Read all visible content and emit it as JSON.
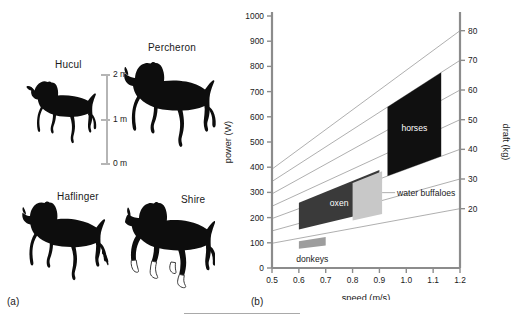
{
  "figure": {
    "panel_a": {
      "tag": "(a)",
      "breeds": [
        {
          "name": "Hucul",
          "icon": "horse-silhouette"
        },
        {
          "name": "Percheron",
          "icon": "horse-silhouette"
        },
        {
          "name": "Haflinger",
          "icon": "horse-silhouette"
        },
        {
          "name": "Shire",
          "icon": "horse-silhouette"
        }
      ],
      "scale_bar": {
        "ticks": [
          "2 m",
          "1 m",
          "0 m"
        ],
        "color": "#b5b5b5"
      }
    },
    "panel_b": {
      "tag": "(b)"
    }
  },
  "chart_data": {
    "type": "area",
    "title": "",
    "xlabel": "speed (m/s)",
    "ylabel": "power (W)",
    "y2label": "draft (kg)",
    "xlim": [
      0.5,
      1.2
    ],
    "ylim": [
      0,
      1000
    ],
    "y2lim": [
      0,
      85
    ],
    "grid": false,
    "legend": "inline-annotations",
    "xticks": [
      "0.5",
      "0.6",
      "0.7",
      "0.8",
      "0.9",
      "1.0",
      "1.1",
      "1.2"
    ],
    "xtick_values": [
      0.5,
      0.6,
      0.7,
      0.8,
      0.9,
      1.0,
      1.1,
      1.2
    ],
    "yticks": [
      "0",
      "100",
      "200",
      "300",
      "400",
      "500",
      "600",
      "700",
      "800",
      "900",
      "1000"
    ],
    "ytick_values": [
      0,
      100,
      200,
      300,
      400,
      500,
      600,
      700,
      800,
      900,
      1000
    ],
    "y2ticks": [
      "20",
      "30",
      "40",
      "50",
      "60",
      "70",
      "80"
    ],
    "y2tick_values": [
      20,
      30,
      40,
      50,
      60,
      70,
      80
    ],
    "draft_lines": [
      {
        "draft_kg": 20,
        "color": "#9a9a9a"
      },
      {
        "draft_kg": 30,
        "color": "#9a9a9a"
      },
      {
        "draft_kg": 40,
        "color": "#9a9a9a"
      },
      {
        "draft_kg": 50,
        "color": "#9a9a9a"
      },
      {
        "draft_kg": 60,
        "color": "#9a9a9a"
      },
      {
        "draft_kg": 70,
        "color": "#9a9a9a"
      },
      {
        "draft_kg": 80,
        "color": "#9a9a9a"
      }
    ],
    "series": [
      {
        "name": "donkeys",
        "label": "donkeys",
        "color": "#9d9d9d",
        "speed_range": [
          0.6,
          0.7
        ],
        "draft_range": [
          13,
          18
        ],
        "power_range": [
          125,
          175
        ],
        "label_position": "below",
        "leader": false
      },
      {
        "name": "oxen",
        "label": "oxen",
        "color": "#3a3a3a",
        "text_color": "#ffffff",
        "speed_range": [
          0.6,
          0.9
        ],
        "draft_range": [
          26,
          44
        ],
        "power_range": [
          250,
          550
        ],
        "label_position": "inside",
        "leader": false
      },
      {
        "name": "water buffaloes",
        "label": "water buffaloes",
        "color": "#c8c8c8",
        "text_color": "#1a1a1a",
        "speed_range": [
          0.8,
          0.91
        ],
        "draft_range": [
          24,
          43
        ],
        "power_range": [
          270,
          530
        ],
        "label_position": "right",
        "leader": true
      },
      {
        "name": "horses",
        "label": "horses",
        "color": "#101010",
        "text_color": "#ffffff",
        "speed_range": [
          0.93,
          1.13
        ],
        "draft_range": [
          40,
          70
        ],
        "power_range": [
          450,
          870
        ],
        "label_position": "inside",
        "leader": false
      }
    ]
  }
}
